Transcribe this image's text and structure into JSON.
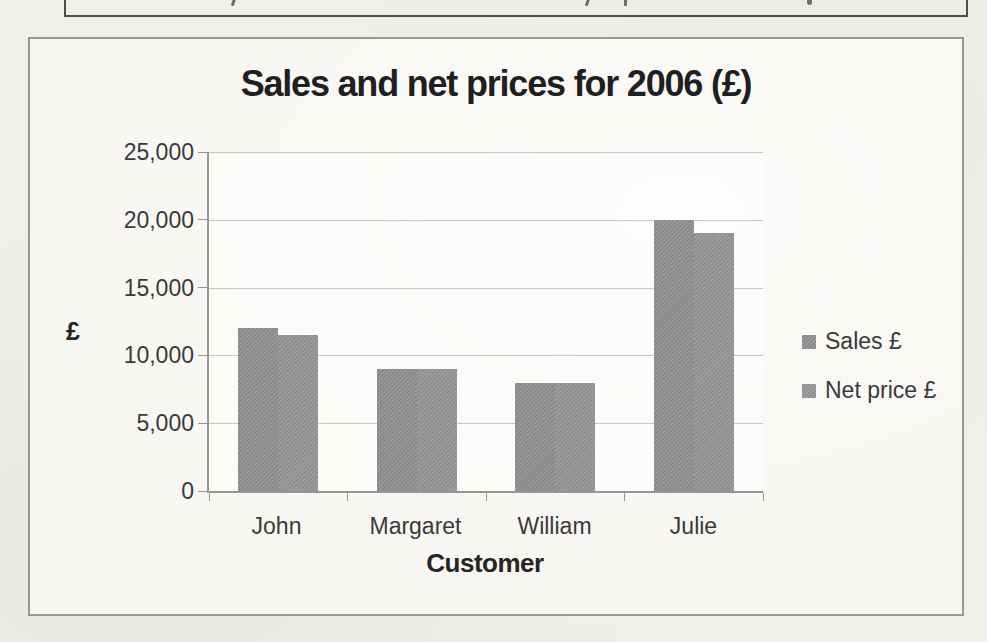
{
  "chart_data": {
    "type": "bar",
    "title": "Sales and net prices for 2006 (£)",
    "categories": [
      "John",
      "Margaret",
      "William",
      "Julie"
    ],
    "series": [
      {
        "name": "Sales £",
        "values": [
          12000,
          9000,
          8000,
          20000
        ],
        "color": "#8d8d8d"
      },
      {
        "name": "Net price £",
        "values": [
          11500,
          9000,
          8000,
          19000
        ],
        "color": "#939393"
      }
    ],
    "xlabel": "Customer",
    "ylabel": "£",
    "ylim": [
      0,
      25000
    ],
    "ytick_step": 5000,
    "ytick_labels": [
      "25,000",
      "20,000",
      "15,000",
      "10,000",
      "5,000",
      "0"
    ],
    "grid": true,
    "legend_position": "right"
  },
  "colors": {
    "paper": "#f0efeb",
    "chart_box_background": "#f8f7f3",
    "chart_box_border": "#979797",
    "top_box_border": "#4d4d4d",
    "axis_line": "#959595",
    "gridline": "#c6c6c6",
    "tick_label_text": "#3a3a3a",
    "title_text": "#1f1f1f"
  }
}
